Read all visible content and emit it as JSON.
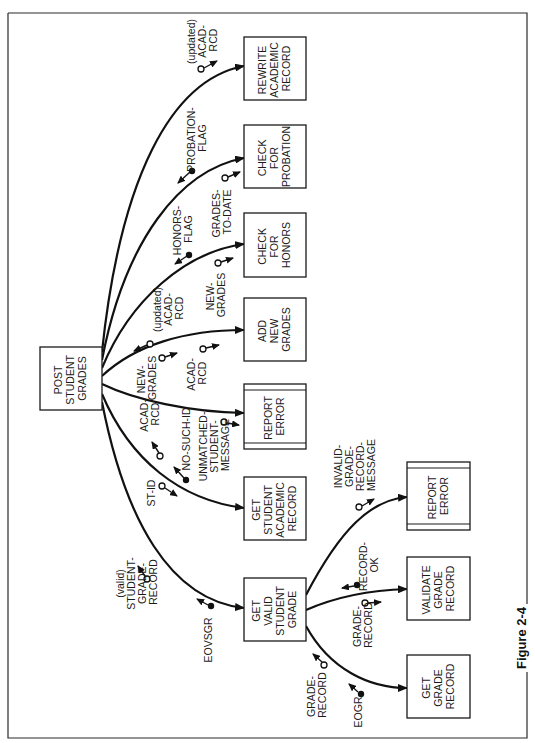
{
  "figure": {
    "caption": "Figure 2-4",
    "orientation": "rotated 90 degrees clockwise (text reads bottom-to-top)"
  },
  "modules": [
    {
      "id": "post",
      "lines": [
        "POST",
        "STUDENT",
        "GRADES"
      ],
      "special": false
    },
    {
      "id": "rewrite",
      "lines": [
        "REWRITE",
        "ACADEMIC",
        "RECORD"
      ],
      "special": false
    },
    {
      "id": "probation",
      "lines": [
        "CHECK",
        "FOR",
        "PROBATION"
      ],
      "special": false
    },
    {
      "id": "honors",
      "lines": [
        "CHECK",
        "FOR",
        "HONORS"
      ],
      "special": false
    },
    {
      "id": "addgrades",
      "lines": [
        "ADD",
        "NEW",
        "GRADES"
      ],
      "special": false
    },
    {
      "id": "reporterror1",
      "lines": [
        "REPORT",
        "ERROR"
      ],
      "special": true
    },
    {
      "id": "getacad",
      "lines": [
        "GET",
        "STUDENT",
        "ACADEMIC",
        "RECORD"
      ],
      "special": false
    },
    {
      "id": "getvalid",
      "lines": [
        "GET",
        "VALID",
        "STUDENT",
        "GRADE"
      ],
      "special": false
    },
    {
      "id": "reporterror2",
      "lines": [
        "REPORT",
        "ERROR"
      ],
      "special": true
    },
    {
      "id": "validate",
      "lines": [
        "VALIDATE",
        "GRADE",
        "RECORD"
      ],
      "special": false
    },
    {
      "id": "getgrade",
      "lines": [
        "GET",
        "GRADE",
        "RECORD"
      ],
      "special": false
    }
  ],
  "couples": [
    {
      "name": "updated-acad-rcd-to-rewrite",
      "lines": [
        "(updated)",
        "ACAD-",
        "RCD"
      ],
      "kind": "data"
    },
    {
      "name": "probation-flag",
      "lines": [
        "PROBATION-",
        "FLAG"
      ],
      "kind": "flag"
    },
    {
      "name": "grades-to-date",
      "lines": [
        "GRADES-",
        "TO-DATE"
      ],
      "kind": "data"
    },
    {
      "name": "honors-flag",
      "lines": [
        "HONORS-",
        "FLAG"
      ],
      "kind": "flag"
    },
    {
      "name": "new-grades-to-honors",
      "lines": [
        "NEW-",
        "GRADES"
      ],
      "kind": "data"
    },
    {
      "name": "updated-acad-rcd-from-add",
      "lines": [
        "(updated)",
        "ACAD-",
        "RCD"
      ],
      "kind": "data"
    },
    {
      "name": "new-grades-to-add",
      "lines": [
        "NEW-",
        "GRADES"
      ],
      "kind": "data"
    },
    {
      "name": "acad-rcd-to-add",
      "lines": [
        "ACAD-",
        "RCD"
      ],
      "kind": "data"
    },
    {
      "name": "unmatched-student-message",
      "lines": [
        "UNMATCHED-",
        "STUDENT-",
        "MESSAGE"
      ],
      "kind": "data"
    },
    {
      "name": "acad-rcd-from-get",
      "lines": [
        "ACAD-",
        "RCD"
      ],
      "kind": "data"
    },
    {
      "name": "no-such-id",
      "lines": [
        "NO-SUCH-ID"
      ],
      "kind": "flag"
    },
    {
      "name": "st-id",
      "lines": [
        "ST-ID"
      ],
      "kind": "data"
    },
    {
      "name": "valid-student-grade-record",
      "lines": [
        "(valid)",
        "STUDENT-",
        "GRADE-",
        "RECORD"
      ],
      "kind": "data"
    },
    {
      "name": "eovsgr",
      "lines": [
        "EOVSGR"
      ],
      "kind": "flag"
    },
    {
      "name": "invalid-grade-record-message",
      "lines": [
        "INVALID-",
        "GRADE-",
        "RECORD-",
        "MESSAGE"
      ],
      "kind": "data"
    },
    {
      "name": "record-ok",
      "lines": [
        "RECORD-",
        "OK"
      ],
      "kind": "flag"
    },
    {
      "name": "grade-record-to-validate",
      "lines": [
        "GRADE-",
        "RECORD"
      ],
      "kind": "data"
    },
    {
      "name": "grade-record-from-get",
      "lines": [
        "GRADE-",
        "RECORD"
      ],
      "kind": "data"
    },
    {
      "name": "eogr",
      "lines": [
        "EOGR"
      ],
      "kind": "flag"
    }
  ]
}
